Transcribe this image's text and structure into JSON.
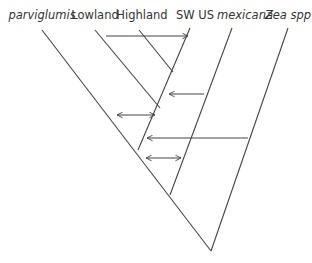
{
  "diagram": {
    "type": "phylogenetic tree with gene flow arrows",
    "taxa": [
      {
        "label": "parviglumis",
        "italic": true
      },
      {
        "label": "Lowland",
        "italic": false
      },
      {
        "label": "Highland",
        "italic": false
      },
      {
        "label": "SW US",
        "italic": false
      },
      {
        "label": "mexicana",
        "italic": true
      },
      {
        "label": "Zea spp",
        "italic": true
      }
    ],
    "gene_flow_arrows": [
      {
        "from": "Lowland",
        "to": "SW US",
        "direction": "right"
      },
      {
        "from": "mexicana",
        "to": "Highland/SW US lineage",
        "direction": "left"
      },
      {
        "between": "parviglumis-lineage",
        "and": "SW US lineage",
        "direction": "both"
      },
      {
        "from": "Zea spp",
        "to": "maize lineage",
        "direction": "left"
      },
      {
        "between": "parviglumis lineage",
        "and": "mexicana",
        "direction": "both"
      }
    ],
    "colors": {
      "line": "#444444",
      "text": "#333333"
    }
  }
}
